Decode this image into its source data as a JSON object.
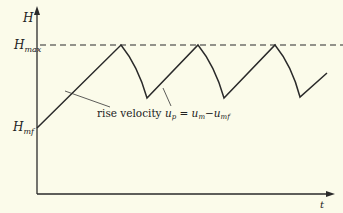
{
  "diagram": {
    "type": "bed-height-vs-time",
    "background": "#fbfbea",
    "line_color": "#2a2a2a",
    "axes": {
      "y_label": "H",
      "x_label": "t"
    },
    "levels": {
      "h_max": {
        "base": "H",
        "sub": "max"
      },
      "h_mf": {
        "base": "H",
        "sub": "mf"
      }
    },
    "annotation": {
      "prefix": "rise velocity ",
      "u_p_base": "u",
      "u_p_sub": "p",
      "equals": " = ",
      "u_m_base": "u",
      "u_m_sub": "m",
      "minus": "−",
      "u_mf_base": "u",
      "u_mf_sub": "mf"
    },
    "curve_points": [
      [
        37,
        128
      ],
      [
        121,
        45
      ],
      [
        147,
        98
      ],
      [
        198,
        45
      ],
      [
        224,
        98
      ],
      [
        275,
        45
      ],
      [
        300,
        97
      ],
      [
        327,
        73
      ]
    ]
  }
}
